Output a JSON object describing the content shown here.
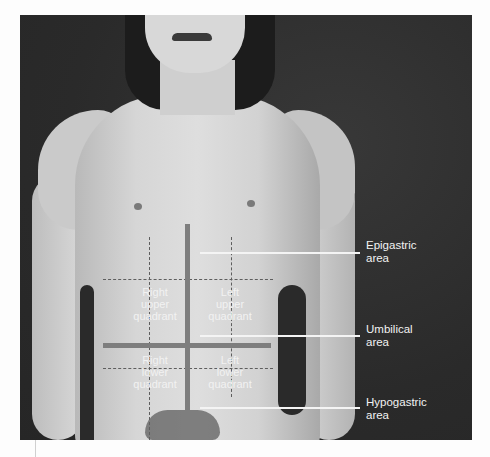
{
  "figure": {
    "background_color": "#2e2e2e",
    "overlay_line_color": "#7e7e7e",
    "pointer_line_color": "#f4f4f4",
    "label_color": "#f2f2f2"
  },
  "quadrants": [
    {
      "id": "ruq",
      "lines": [
        "Right",
        "upper",
        "quadrant"
      ]
    },
    {
      "id": "luq",
      "lines": [
        "Left",
        "upper",
        "quadrant"
      ]
    },
    {
      "id": "rlq",
      "lines": [
        "Right",
        "lower",
        "quadrant"
      ]
    },
    {
      "id": "llq",
      "lines": [
        "Left",
        "lower",
        "quadrant"
      ]
    }
  ],
  "areas": [
    {
      "id": "epigastric",
      "lines": [
        "Epigastric",
        "area"
      ]
    },
    {
      "id": "umbilical",
      "lines": [
        "Umbilical",
        "area"
      ]
    },
    {
      "id": "hypogastric",
      "lines": [
        "Hypogastric",
        "area"
      ]
    }
  ]
}
